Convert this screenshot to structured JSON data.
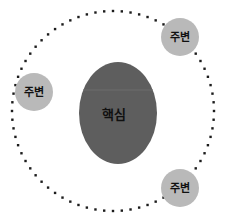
{
  "diagram": {
    "type": "concentric-orbit",
    "background_color": "#ffffff",
    "core": {
      "label": "핵심",
      "shape": "ellipse",
      "fill_color": "#5e5e5e",
      "text_color": "#101010",
      "cx": 118,
      "cy": 113,
      "rx": 39,
      "ry": 51
    },
    "orbit": {
      "name": "dotted-orbit-ring",
      "style": "dotted",
      "dot_color": "#1c1c1c",
      "dot_size": 2.4,
      "dot_count": 72,
      "cx": 113,
      "cy": 111,
      "rx": 101,
      "ry": 100
    },
    "satellites": [
      {
        "id": "satellite-top-right",
        "label": "주변",
        "fill_color": "#b9b9b9",
        "text_color": "#101010",
        "cx": 180,
        "cy": 37,
        "r": 19
      },
      {
        "id": "satellite-left",
        "label": "주변",
        "fill_color": "#b9b9b9",
        "text_color": "#101010",
        "cx": 34,
        "cy": 92,
        "r": 19
      },
      {
        "id": "satellite-bottom-right",
        "label": "주변",
        "fill_color": "#b9b9b9",
        "text_color": "#101010",
        "cx": 180,
        "cy": 188,
        "r": 19
      }
    ]
  }
}
